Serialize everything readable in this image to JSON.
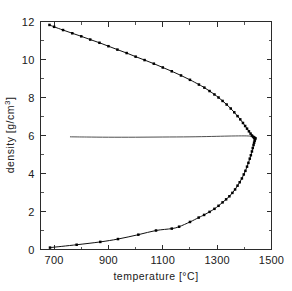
{
  "chart_data": {
    "type": "scatter",
    "title": "",
    "xlabel": "temperature [°C]",
    "ylabel": "density [g/cm³]",
    "xlim": [
      650,
      1500
    ],
    "ylim": [
      0,
      12
    ],
    "xticks": [
      700,
      900,
      1100,
      1300,
      1500
    ],
    "xticklabels": [
      "700",
      "900",
      "1100",
      "1300",
      "1500"
    ],
    "xminorticks": [
      800,
      1000,
      1200,
      1400
    ],
    "yticks": [
      0,
      2,
      4,
      6,
      8,
      10,
      12
    ],
    "yticklabels": [
      "0",
      "2",
      "4",
      "6",
      "8",
      "10",
      "12"
    ],
    "yminorticks": [
      1,
      3,
      5,
      7,
      9,
      11
    ],
    "grid": false,
    "legend": null,
    "frame": "box",
    "critical_point": {
      "temperature": 1440,
      "density": 5.85
    },
    "series": [
      {
        "name": "liquid branch (upper)",
        "marker": "square",
        "line": "solid",
        "x": [
          683,
          700,
          733,
          767,
          800,
          833,
          867,
          900,
          933,
          967,
          1000,
          1033,
          1067,
          1100,
          1133,
          1167,
          1200,
          1233,
          1253,
          1272,
          1290,
          1305,
          1320,
          1335,
          1350,
          1363,
          1375,
          1385,
          1395,
          1403,
          1410,
          1417,
          1423,
          1428,
          1432,
          1435,
          1437,
          1439,
          1440
        ],
        "y": [
          11.82,
          11.72,
          11.55,
          11.38,
          11.22,
          11.05,
          10.88,
          10.7,
          10.52,
          10.34,
          10.15,
          9.97,
          9.78,
          9.58,
          9.38,
          9.16,
          8.93,
          8.68,
          8.52,
          8.34,
          8.16,
          8.0,
          7.82,
          7.63,
          7.42,
          7.22,
          7.02,
          6.85,
          6.66,
          6.5,
          6.36,
          6.22,
          6.1,
          6.0,
          5.94,
          5.9,
          5.88,
          5.86,
          5.85
        ]
      },
      {
        "name": "vapour branch (lower)",
        "marker": "square",
        "line": "solid",
        "x": [
          685,
          783,
          870,
          935,
          1010,
          1075,
          1133,
          1160,
          1200,
          1232,
          1252,
          1272,
          1290,
          1305,
          1320,
          1333,
          1345,
          1356,
          1366,
          1375,
          1383,
          1391,
          1398,
          1404,
          1410,
          1415,
          1420,
          1424,
          1428,
          1431,
          1434,
          1436,
          1438,
          1439,
          1440
        ],
        "y": [
          0.1,
          0.25,
          0.4,
          0.55,
          0.78,
          1.0,
          1.1,
          1.2,
          1.45,
          1.68,
          1.82,
          1.98,
          2.14,
          2.3,
          2.48,
          2.64,
          2.8,
          2.98,
          3.16,
          3.36,
          3.54,
          3.74,
          3.95,
          4.14,
          4.36,
          4.56,
          4.78,
          4.96,
          5.16,
          5.34,
          5.5,
          5.62,
          5.72,
          5.8,
          5.85
        ]
      },
      {
        "name": "rectilinear diameter (mean density)",
        "marker": "none",
        "line": "solid",
        "x": [
          760,
          820,
          900,
          1000,
          1100,
          1200,
          1280,
          1340,
          1390,
          1420,
          1435,
          1440
        ],
        "y": [
          5.93,
          5.92,
          5.91,
          5.91,
          5.92,
          5.93,
          5.95,
          5.97,
          5.98,
          5.97,
          5.92,
          5.85
        ]
      }
    ]
  },
  "axes": {
    "x_title": "temperature [°C]",
    "y_title": "density [g/cm³]",
    "y_title_parts": {
      "base": "density [g/cm",
      "sup": "3",
      "tail": "]"
    }
  }
}
